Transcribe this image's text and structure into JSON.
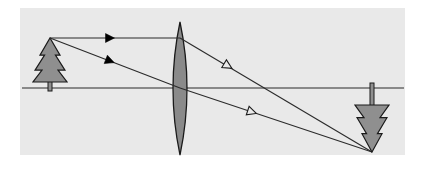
{
  "figure": {
    "title": "Converging lens ray diagram",
    "canvas": {
      "width": 424,
      "height": 171,
      "background": "#ffffff"
    },
    "panel": {
      "name": "diagram-panel",
      "x": 20,
      "y": 8,
      "width": 385,
      "height": 147,
      "fill": "#e9e9e9",
      "stroke": "none"
    },
    "colors": {
      "panel_background": "#e9e9e9",
      "page_background": "#ffffff",
      "object_fill": "#8f8f8f",
      "object_stroke": "#1a1a1a",
      "lens_fill": "#8a8a8a",
      "lens_stroke": "#1a1a1a",
      "ray_stroke": "#2b2b2b",
      "axis_stroke": "#2b2b2b",
      "arrowhead_solid": "#000000",
      "arrowhead_hollow_fill": "#e9e9e9"
    },
    "optical_axis": {
      "name": "optical-axis",
      "label": "optical axis",
      "x1": 22,
      "y1": 88,
      "x2": 404,
      "y2": 88,
      "stroke_width": 1.2
    },
    "lens": {
      "name": "converging-lens",
      "label": "converging lens",
      "center_x": 180,
      "top_y": 22,
      "bottom_y": 155,
      "half_width": 14,
      "stroke_width": 1.3
    },
    "object": {
      "name": "object-tree",
      "label": "object (tree)",
      "apex_x": 50,
      "apex_y": 38,
      "base_y": 82,
      "half_width": 17,
      "trunk_width": 4,
      "trunk_bottom_y": 91,
      "orientation": "upright"
    },
    "image": {
      "name": "image-tree-inverted",
      "label": "image (inverted tree)",
      "apex_x": 372,
      "apex_y": 152,
      "base_y": 105,
      "half_width": 17,
      "trunk_width": 4,
      "trunk_top_y": 83,
      "orientation": "inverted"
    },
    "rays": [
      {
        "name": "parallel-ray",
        "label": "ray parallel to axis, refracted through focal point",
        "incident": {
          "x1": 50,
          "y1": 38,
          "x2": 180,
          "y2": 38
        },
        "refracted": {
          "x1": 180,
          "y1": 38,
          "x2": 372,
          "y2": 152
        },
        "incident_arrowhead": {
          "type": "solid",
          "x": 110,
          "y": 38,
          "angle_deg": 0
        },
        "refracted_arrowhead": {
          "type": "hollow",
          "x": 228,
          "y": 66,
          "angle_deg": 30.7
        }
      },
      {
        "name": "center-ray",
        "label": "ray through the optical centre, undeviated",
        "incident": {
          "x1": 50,
          "y1": 38,
          "x2": 180,
          "y2": 88
        },
        "refracted": {
          "x1": 180,
          "y1": 88,
          "x2": 372,
          "y2": 152
        },
        "incident_arrowhead": {
          "type": "solid",
          "x": 110,
          "y": 61,
          "angle_deg": 21.0
        },
        "refracted_arrowhead": {
          "type": "hollow",
          "x": 252,
          "y": 112,
          "angle_deg": 18.4
        }
      }
    ],
    "arrowheads": {
      "solid_count": 2,
      "hollow_count": 2,
      "solid_size": 9,
      "hollow_size": 9
    }
  }
}
